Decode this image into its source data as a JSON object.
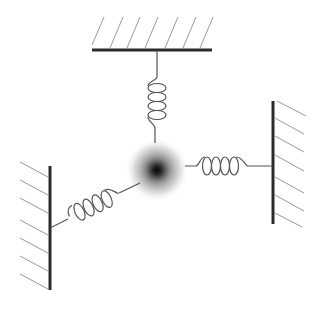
{
  "diagram": {
    "title": "",
    "colors": {
      "background": "#ffffff",
      "wall": "#2a2a2a",
      "hatch": "#9a9a9a",
      "spring": "#555555",
      "mass_core": "#0a0a0a",
      "mass_edge": "#ffffff"
    },
    "mass": {
      "cx": 157,
      "cy": 170,
      "r": 32
    },
    "walls": [
      {
        "id": "top",
        "x1": 92,
        "y1": 50,
        "x2": 212,
        "y2": 50
      },
      {
        "id": "right",
        "x1": 273,
        "y1": 101,
        "x2": 273,
        "y2": 224
      },
      {
        "id": "left",
        "x1": 50,
        "y1": 166,
        "x2": 50,
        "y2": 290
      }
    ],
    "springs": [
      {
        "id": "top",
        "from": "top-wall",
        "to": "mass",
        "coils": 5
      },
      {
        "id": "right",
        "from": "mass",
        "to": "right-wall",
        "coils": 5
      },
      {
        "id": "left",
        "from": "left-wall",
        "to": "mass",
        "coils": 5
      }
    ]
  }
}
